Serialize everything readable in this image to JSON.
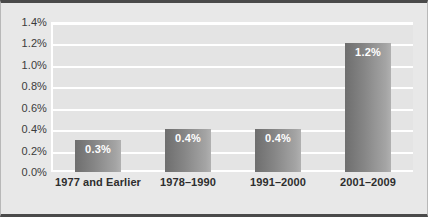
{
  "chart_data": {
    "type": "bar",
    "title": "",
    "xlabel": "",
    "ylabel": "",
    "categories": [
      "1977 and Earlier",
      "1978–1990",
      "1991–2000",
      "2001–2009"
    ],
    "values": [
      0.3,
      0.4,
      0.4,
      1.2
    ],
    "value_labels": [
      "0.3%",
      "0.4%",
      "0.4%",
      "1.2%"
    ],
    "ylim": [
      0.0,
      1.4
    ],
    "ytick_labels": [
      "1.4%",
      "1.2%",
      "1.0%",
      "0.8%",
      "0.6%",
      "0.4%",
      "0.2%",
      "0.0%"
    ],
    "ytick_values": [
      1.4,
      1.2,
      1.0,
      0.8,
      0.6,
      0.4,
      0.2,
      0.0
    ],
    "grid": true,
    "legend": false,
    "legend_position": "none",
    "colors": {
      "bar_gradient_start": "#6e6e6e",
      "bar_gradient_end": "#b0b0b0",
      "plot_background": "#e4e4e4",
      "figure_background": "#e8e8e8",
      "gridline": "#ffffff",
      "frame_rule": "#4a4a4a",
      "value_label": "#ffffff",
      "tick_label": "#3b3b3b"
    }
  }
}
